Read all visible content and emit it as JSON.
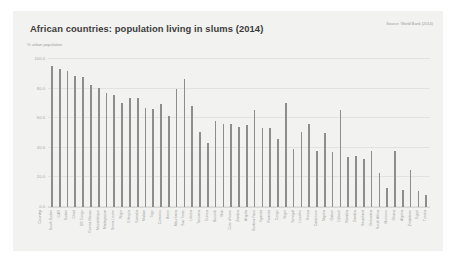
{
  "chart_data": {
    "type": "bar",
    "title": "African countries: population living in slums (2014)",
    "subtitle": "% urban population",
    "source": "Source: World Bank (2014)",
    "xlabel": "Country",
    "ylabel": "% urban population",
    "ylim": [
      0,
      100
    ],
    "yticks": [
      "0.0",
      "20.0",
      "40.0",
      "60.0",
      "80.0",
      "100.0"
    ],
    "grid": true,
    "legend": "none",
    "bar_color": "#8d8d8b",
    "categories": [
      "South Sudan",
      "CAR",
      "Sudan",
      "Chad",
      "DR Congo",
      "Guinea-Bissau",
      "Mozambique",
      "Madagascar",
      "Sierra Leone",
      "Niger",
      "Ethiopia",
      "Somalia",
      "Malawi",
      "Togo",
      "Comoros",
      "Benin",
      "Mauritania",
      "Sao Tome",
      "Liberia",
      "Tanzania",
      "Guinea",
      "Burundi",
      "Mali",
      "Cote d'Ivoire",
      "Zambia",
      "Angola",
      "Burkina Faso",
      "Uganda",
      "Rwanda",
      "Congo",
      "Niger",
      "Senegal",
      "Lesotho",
      "Kenya",
      "Cameroon",
      "Nigeria",
      "Gabon",
      "Djibouti",
      "Namibia",
      "Gambia",
      "Swaziland",
      "Botswana",
      "South Africa",
      "Morocco",
      "Ghana",
      "Algeria",
      "Zimbabwe",
      "Egypt",
      "Tunisia"
    ],
    "values": [
      95.6,
      93.3,
      91.6,
      88.2,
      87.7,
      82.3,
      80.3,
      77.2,
      75.6,
      70.1,
      73.9,
      73.6,
      66.7,
      66.5,
      69.6,
      61.5,
      79.9,
      86.5,
      68.3,
      50.7,
      43.3,
      57.9,
      56.3,
      56.0,
      54.0,
      55.5,
      65.8,
      53.6,
      53.2,
      46.1,
      70.1,
      39.4,
      50.8,
      56.0,
      37.8,
      50.2,
      37.0,
      65.6,
      33.9,
      34.8,
      32.5,
      37.9,
      23.0,
      13.1,
      37.9,
      11.8,
      25.1,
      10.6,
      8.0
    ]
  }
}
